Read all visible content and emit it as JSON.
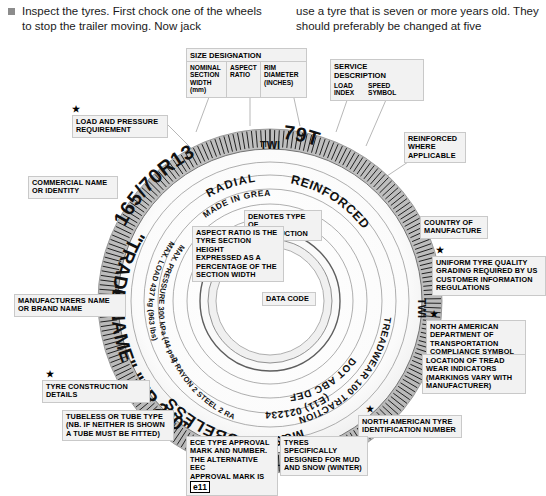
{
  "page": {
    "body_text_left": "Inspect the tyres. First chock one of the wheels to stop the trailer moving. Now jack",
    "body_text_right": "use a tyre that is seven or more years old. They should preferably be changed at five"
  },
  "size_designation": {
    "title": "SIZE DESIGNATION",
    "columns": [
      "NOMINAL\nSECTION\nWIDTH\n(mm)",
      "ASPECT\nRATIO",
      "RIM\nDIAMETER\n(INCHES)"
    ]
  },
  "service_description": {
    "title": "SERVICE DESCRIPTION",
    "columns": [
      "LOAD\nINDEX",
      "SPEED\nSYMBOL"
    ]
  },
  "callouts": {
    "load_pressure": "LOAD AND PRESSURE\nREQUIREMENT",
    "commercial_name": "COMMERCIAL NAME\nOR IDENTITY",
    "manufacturers_name": "MANUFACTURERS NAME\nOR BRAND NAME",
    "tyre_construction": "TYRE CONSTRUCTION DETAILS",
    "denotes_type": "DENOTES TYPE\nOF CONSTRUCTION",
    "aspect_ratio": "ASPECT RATIO IS THE\nTYRE SECTION HEIGHT\nEXPRESSED AS A\nPERCENTAGE OF THE\nSECTION WIDTH",
    "data_code": "DATA CODE",
    "reinforced": "REINFORCED\nWHERE\nAPPLICABLE",
    "country_manufacture": "COUNTRY OF\nMANUFACTURE",
    "uniform_grading": "UNIFORM TYRE QUALITY\nGRADING REQUIRED BY US\nCUSTOMER INFORMATION\nREGULATIONS",
    "dot_symbol": "NORTH AMERICAN\nDEPARTMENT OF\nTRANSPORTATION\nCOMPLIANCE SYMBOL",
    "tread_wear_indicators": "LOCATION OF TREAD\nWEAR INDICATORS\n(MARKINGS VARY WITH\nMANUFACTURER)",
    "na_tyre_id": "NORTH AMERICAN TYRE\nIDENTIFICATION NUMBER",
    "tubeless_tube": "TUBELESS OR TUBE TYPE\n(NB. IF NEITHER IS SHOWN\nA TUBE MUST BE FITTED)",
    "ece_approval_prefix": "ECE TYPE APPROVAL\nMARK AND NUMBER.\nTHE ALTERNATIVE EEC\nAPPROVAL MARK IS ",
    "ece_approval_mark": "e11",
    "mud_snow": "TYRES SPECIFICALLY\nDESIGNED FOR MUD\nAND SNOW (WINTER)"
  },
  "tyre_markings": {
    "size": "165/70R13",
    "service": "79T",
    "radial": "RADIAL",
    "reinforced": "REINFORCED",
    "made_in": "MADE IN GREAT BRITAIN",
    "trade_name": "\"TRADE NAME\" \"XP 200\"",
    "max_load": "MAX. LOAD 437 kg (963 lbs)",
    "max_pressure": "MAX. PRESSURE 300 kPa (44 psi)",
    "construction": "2 RAYON 2 STEEL 2 RAYON",
    "treadwear": "TREADWEAR 100 TRACTION A TEMPERATURE B",
    "dot_number": "DOT ABC DEF 343",
    "ece_number": "(E11) 021234",
    "tubeless": "TUBELESS",
    "mud_snow": "M&S",
    "twi": "TWI"
  },
  "colors": {
    "label_bg": "#f2f2f2",
    "label_border": "#c9c9c9",
    "tyre_dark": "#1c1c1c",
    "sidewall": "#ffffff",
    "leader": "#9a9a9a"
  }
}
